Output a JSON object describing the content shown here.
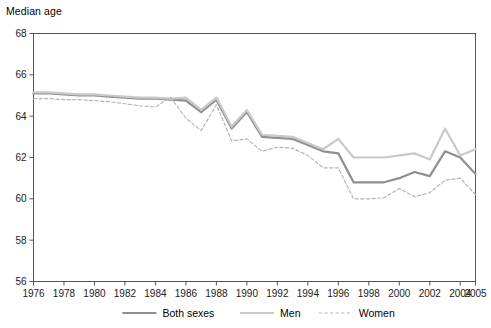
{
  "chart_data": {
    "type": "line",
    "title": "Median age",
    "xlabel": "",
    "ylabel": "Median age",
    "ylim": [
      56,
      68
    ],
    "xlim": [
      1976,
      2005
    ],
    "ytick_step": 2,
    "yticks": [
      56,
      58,
      60,
      62,
      64,
      66,
      68
    ],
    "xticks": [
      1976,
      1978,
      1980,
      1982,
      1984,
      1986,
      1988,
      1990,
      1992,
      1994,
      1996,
      1998,
      2000,
      2002,
      2004,
      2005
    ],
    "grid": false,
    "legend_position": "bottom",
    "x": [
      1976,
      1977,
      1978,
      1979,
      1980,
      1981,
      1982,
      1983,
      1984,
      1985,
      1986,
      1987,
      1988,
      1989,
      1990,
      1991,
      1992,
      1993,
      1994,
      1995,
      1996,
      1997,
      1998,
      1999,
      2000,
      2001,
      2002,
      2003,
      2004,
      2005
    ],
    "series": [
      {
        "name": "Both sexes",
        "color": "#8f8f8f",
        "style": "solid",
        "width": 2.2,
        "values": [
          65.1,
          65.1,
          65.05,
          65.0,
          65.0,
          64.95,
          64.9,
          64.85,
          64.85,
          64.8,
          64.75,
          64.2,
          64.8,
          63.4,
          64.2,
          63.0,
          62.95,
          62.9,
          62.6,
          62.3,
          62.2,
          60.8,
          60.8,
          60.8,
          61.0,
          61.3,
          61.1,
          62.3,
          62.0,
          61.2
        ]
      },
      {
        "name": "Men",
        "color": "#c9c9c9",
        "style": "solid",
        "width": 2.2,
        "values": [
          65.15,
          65.15,
          65.1,
          65.05,
          65.05,
          65.0,
          64.95,
          64.9,
          64.9,
          64.85,
          64.9,
          64.3,
          64.9,
          63.5,
          64.3,
          63.1,
          63.05,
          63.0,
          62.7,
          62.4,
          62.9,
          62.0,
          62.0,
          62.0,
          62.1,
          62.2,
          61.9,
          63.4,
          62.1,
          62.4
        ]
      },
      {
        "name": "Women",
        "color": "#b5b5b5",
        "style": "dashed",
        "width": 1.2,
        "values": [
          64.85,
          64.85,
          64.8,
          64.8,
          64.75,
          64.7,
          64.6,
          64.5,
          64.45,
          64.9,
          63.9,
          63.3,
          64.55,
          62.8,
          62.9,
          62.3,
          62.5,
          62.45,
          62.1,
          61.5,
          61.5,
          60.0,
          60.0,
          60.05,
          60.5,
          60.1,
          60.3,
          60.9,
          61.0,
          60.2
        ]
      }
    ]
  },
  "legend": {
    "items": [
      {
        "label": "Both sexes"
      },
      {
        "label": "Men"
      },
      {
        "label": "Women"
      }
    ]
  },
  "colors": {
    "both_sexes": "#8f8f8f",
    "men": "#c9c9c9",
    "women": "#b5b5b5",
    "axis": "#555555",
    "text": "#000000"
  }
}
